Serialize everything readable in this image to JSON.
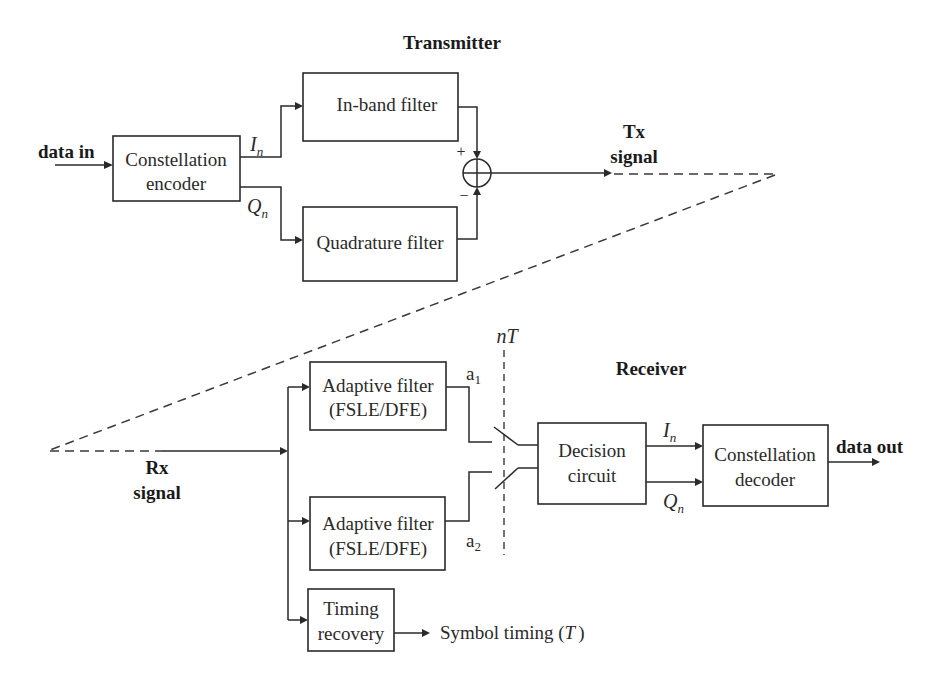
{
  "diagram": {
    "title_transmitter": "Transmitter",
    "title_receiver": "Receiver",
    "transmitter": {
      "input_label": "data in",
      "encoder": {
        "line1": "Constellation",
        "line2": "encoder"
      },
      "i_label": "I",
      "i_sub": "n",
      "q_label": "Q",
      "q_sub": "n",
      "inband_filter": "In-band filter",
      "quadrature_filter": "Quadrature filter",
      "summer_plus": "+",
      "summer_minus": "−",
      "output_label": {
        "line1": "Tx",
        "line2": "signal"
      }
    },
    "channel": {
      "style": "dashed"
    },
    "receiver": {
      "input_label": {
        "line1": "Rx",
        "line2": "signal"
      },
      "adaptive_filter_1": {
        "line1": "Adaptive filter",
        "line2": "(FSLE/DFE)"
      },
      "adaptive_filter_2": {
        "line1": "Adaptive filter",
        "line2": "(FSLE/DFE)"
      },
      "a1_label": "a",
      "a1_sub": "1",
      "a2_label": "a",
      "a2_sub": "2",
      "sampler_label": "nT",
      "decision_circuit": {
        "line1": "Decision",
        "line2": "circuit"
      },
      "i_label": "I",
      "i_sub": "n",
      "q_label": "Q",
      "q_sub": "n",
      "decoder": {
        "line1": "Constellation",
        "line2": "decoder"
      },
      "output_label": "data out",
      "timing_recovery": {
        "line1": "Timing",
        "line2": "recovery"
      },
      "symbol_timing_label": "Symbol timing (",
      "symbol_timing_T": "T",
      "symbol_timing_close": ")"
    }
  }
}
